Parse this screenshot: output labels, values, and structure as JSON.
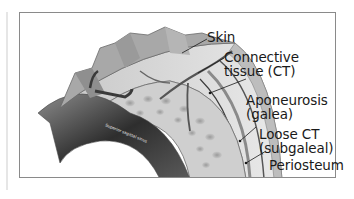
{
  "figure": {
    "labels": [
      {
        "id": "skin",
        "line1": "Skin",
        "line2": ""
      },
      {
        "id": "connective-tissue",
        "line1": "Connective",
        "line2": "tissue (CT)"
      },
      {
        "id": "aponeurosis",
        "line1": "Aponeurosis",
        "line2": "(galea)"
      },
      {
        "id": "loose-ct",
        "line1": "Loose CT",
        "line2": "(subgaleal)"
      },
      {
        "id": "periosteum",
        "line1": "Periosteum",
        "line2": ""
      }
    ],
    "inner_labels": {
      "sinus": "Superior sagittal sinus",
      "bone": "Skull bone"
    }
  },
  "colors": {
    "frame_border": "#8a8a8a",
    "background": "#ffffff",
    "text": "#1a1a1a",
    "tissue_light": "#d9d9d9",
    "tissue_dark": "#3a3a3a"
  }
}
